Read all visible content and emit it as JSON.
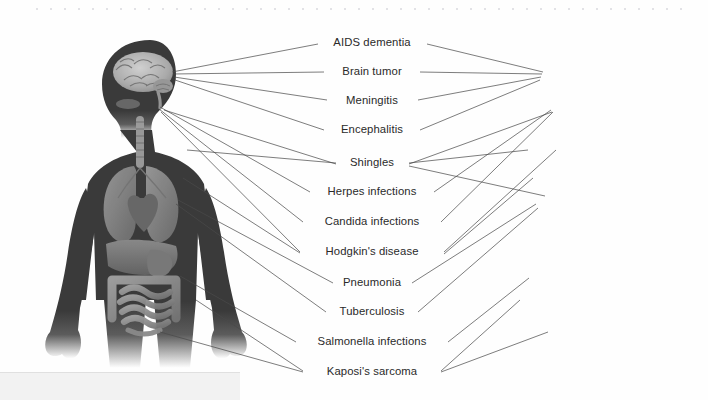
{
  "figure": {
    "caption": "",
    "background_color": "#fefefe",
    "body_silhouette_color": "#3a3a3a",
    "organ_tone_color": "#8a8a8a",
    "leader_line_color": "#4a4a4a",
    "label_text_color": "#2a2a2a"
  },
  "labels": [
    {
      "id": "aids-dementia",
      "text": "AIDS dementia",
      "x": 372,
      "y": 43,
      "target_left": "brain",
      "target_right": "brain"
    },
    {
      "id": "brain-tumor",
      "text": "Brain tumor",
      "x": 372,
      "y": 72,
      "target_left": "brain",
      "target_right": "brain"
    },
    {
      "id": "meningitis",
      "text": "Meningitis",
      "x": 372,
      "y": 101,
      "target_left": "brain",
      "target_right": "brain"
    },
    {
      "id": "encephalitis",
      "text": "Encephalitis",
      "x": 372,
      "y": 130,
      "target_left": "brain",
      "target_right": "brain"
    },
    {
      "id": "shingles",
      "text": "Shingles",
      "x": 372,
      "y": 163,
      "target_left": "torso",
      "target_right": "torso"
    },
    {
      "id": "herpes-infections",
      "text": "Herpes infections",
      "x": 372,
      "y": 192,
      "target_left": "mouth",
      "target_right": "mouth"
    },
    {
      "id": "candida-infections",
      "text": "Candida infections",
      "x": 372,
      "y": 222,
      "target_left": "mouth",
      "target_right": "mouth"
    },
    {
      "id": "hodgkins-disease",
      "text": "Hodgkin's disease",
      "x": 372,
      "y": 252,
      "target_left": "lymph",
      "target_right": "lymph"
    },
    {
      "id": "pneumonia",
      "text": "Pneumonia",
      "x": 372,
      "y": 283,
      "target_left": "lungs",
      "target_right": "lungs"
    },
    {
      "id": "tuberculosis",
      "text": "Tuberculosis",
      "x": 372,
      "y": 312,
      "target_left": "lungs",
      "target_right": "lungs"
    },
    {
      "id": "salmonella-infections",
      "text": "Salmonella infections",
      "x": 372,
      "y": 342,
      "target_left": "intestine",
      "target_right": "intestine"
    },
    {
      "id": "kaposis-sarcoma",
      "text": "Kaposi's sarcoma",
      "x": 372,
      "y": 372,
      "target_left": "skin-leg",
      "target_right": "skin-leg"
    }
  ],
  "figures": [
    {
      "id": "left-figure",
      "name": "male-anatomical-figure",
      "facing": "right",
      "bounds": {
        "x": 20,
        "y": 40,
        "width": 215,
        "height": 345
      },
      "organs_visible": [
        "brain",
        "trachea",
        "lungs",
        "heart",
        "liver",
        "stomach",
        "small-intestine",
        "large-intestine"
      ]
    },
    {
      "id": "right-figure",
      "name": "female-anatomical-figure",
      "facing": "left",
      "bounds": {
        "x": 455,
        "y": 40,
        "width": 205,
        "height": 345
      },
      "organs_visible": [
        "brain",
        "trachea",
        "lungs",
        "heart",
        "liver",
        "stomach",
        "small-intestine",
        "large-intestine"
      ]
    }
  ],
  "anchors": {
    "left": {
      "brain": [
        172,
        72
      ],
      "mouth": [
        158,
        106
      ],
      "torso": [
        185,
        152
      ],
      "lymph": [
        180,
        178
      ],
      "lungs": [
        178,
        200
      ],
      "intestine": [
        180,
        275
      ],
      "skin-leg": [
        160,
        330
      ]
    },
    "right": {
      "brain": [
        543,
        72
      ],
      "mouth": [
        553,
        106
      ],
      "torso": [
        527,
        152
      ],
      "lymph": [
        532,
        178
      ],
      "lungs": [
        534,
        200
      ],
      "intestine": [
        530,
        275
      ],
      "skin-leg": [
        548,
        330
      ]
    }
  },
  "page_marks": {
    "top_dotted_rule": "scan-edge-dots",
    "bottom_left_band": "scan-shadow-band"
  }
}
